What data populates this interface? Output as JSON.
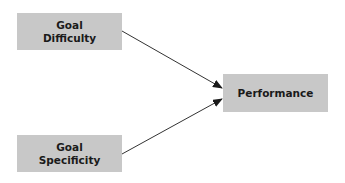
{
  "diagram": {
    "nodes": [
      {
        "id": "goal-difficulty",
        "line1": "Goal",
        "line2": "Difficulty"
      },
      {
        "id": "performance",
        "label": "Performance"
      },
      {
        "id": "goal-specificity",
        "line1": "Goal",
        "line2": "Specificity"
      }
    ],
    "edges": [
      {
        "from": "goal-difficulty",
        "to": "performance"
      },
      {
        "from": "goal-specificity",
        "to": "performance"
      }
    ],
    "colors": {
      "box_fill": "#c8c8c8",
      "arrow": "#333333",
      "text": "#1a1a1a"
    }
  }
}
